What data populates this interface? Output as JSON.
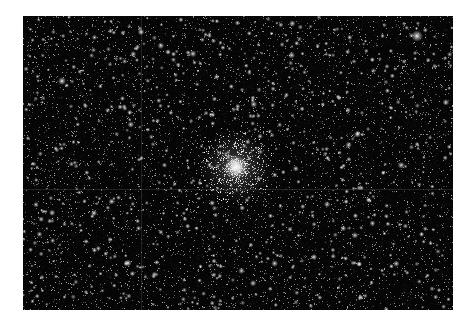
{
  "image": {
    "alt": "Globular star cluster in a dense star field",
    "subject": "globular-cluster",
    "frame": {
      "x": 23,
      "y": 16,
      "width": 430,
      "height": 294
    },
    "background_color": "#050505",
    "page_background": "#ffffff"
  },
  "field": {
    "seed": 20240517,
    "faint_star_count": 5200,
    "medium_star_count": 650,
    "bright_star_count": 45
  },
  "cluster": {
    "center_x": 213,
    "center_y": 151,
    "core_radius": 6,
    "halo_radius": 38,
    "member_count": 900
  },
  "notable_stars": [
    {
      "x": 394,
      "y": 20,
      "size": 2.6
    },
    {
      "x": 39,
      "y": 65,
      "size": 1.8
    },
    {
      "x": 118,
      "y": 16,
      "size": 1.5
    },
    {
      "x": 105,
      "y": 247,
      "size": 1.6
    },
    {
      "x": 71,
      "y": 197,
      "size": 1.4
    },
    {
      "x": 291,
      "y": 241,
      "size": 1.4
    },
    {
      "x": 336,
      "y": 248,
      "size": 1.3
    },
    {
      "x": 145,
      "y": 36,
      "size": 1.3
    }
  ],
  "seams": {
    "vertical_x": 118,
    "horizontal_y": 173,
    "color": "rgba(90,90,90,0.35)"
  }
}
